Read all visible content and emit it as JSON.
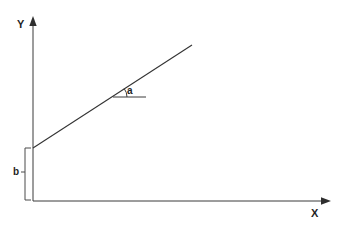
{
  "figure": {
    "background_color": "#ffffff",
    "line_color": "#333333",
    "axis_color": "#3a3a3a",
    "text_color": "#1f1f1f",
    "width": 342,
    "height": 226
  },
  "axes": {
    "y": {
      "label": "Y",
      "icon": "arrow-up-icon",
      "origin_px": {
        "x": 33,
        "y": 201
      },
      "tip_px": {
        "x": 33,
        "y": 18
      }
    },
    "x": {
      "label": "X",
      "icon": "arrow-right-icon",
      "origin_px": {
        "x": 33,
        "y": 201
      },
      "tip_px": {
        "x": 330,
        "y": 201
      }
    }
  },
  "plot_line": {
    "name": "straight-line",
    "start_px": {
      "x": 33,
      "y": 148
    },
    "end_px": {
      "x": 192,
      "y": 45
    }
  },
  "annotations": {
    "angle": {
      "label": "a",
      "meaning": "angle of inclination between the line and the horizontal reference",
      "vertex_px": {
        "x": 113,
        "y": 97
      },
      "reference_end_px": {
        "x": 146,
        "y": 97
      },
      "arc_radius_px": 14
    },
    "intercept": {
      "label": "b",
      "meaning": "y-intercept measured from the origin up to the line",
      "bracket_x_px": 25,
      "bracket_top_px": 148,
      "bracket_bottom_px": 200
    }
  }
}
